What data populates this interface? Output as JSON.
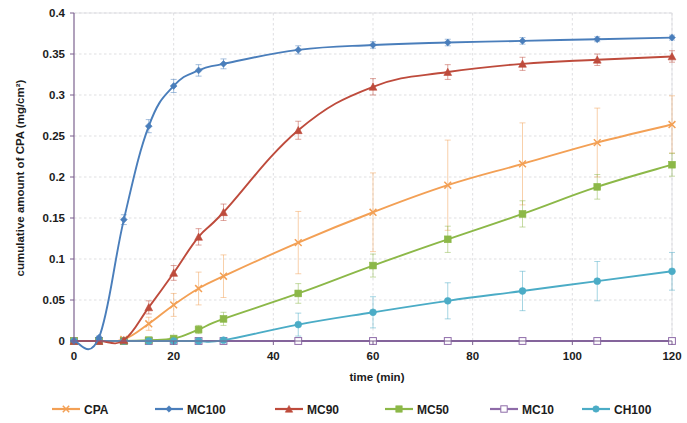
{
  "chart_data": {
    "type": "line",
    "title": "",
    "xlabel": "time (min)",
    "ylabel": "cumulative amount of CPA (mg/cm²)",
    "xlim": [
      0,
      120
    ],
    "ylim": [
      0,
      0.4
    ],
    "xticks": [
      "0",
      "20",
      "40",
      "60",
      "80",
      "100",
      "120"
    ],
    "xtick_values": [
      0,
      20,
      40,
      60,
      80,
      100,
      120
    ],
    "yticks": [
      "0",
      "0.05",
      "0.1",
      "0.15",
      "0.2",
      "0.25",
      "0.3",
      "0.35",
      "0.4"
    ],
    "ytick_values": [
      0,
      0.05,
      0.1,
      0.15,
      0.2,
      0.25,
      0.3,
      0.35,
      0.4
    ],
    "grid": true,
    "legend_position": "bottom",
    "x": [
      0,
      5,
      10,
      15,
      20,
      25,
      30,
      45,
      60,
      75,
      90,
      105,
      120
    ],
    "series": [
      {
        "name": "CPA",
        "color": "#F3A055",
        "marker": "cross",
        "values": [
          0,
          0,
          0.002,
          0.021,
          0.044,
          0.064,
          0.079,
          0.12,
          0.157,
          0.19,
          0.216,
          0.242,
          0.264
        ],
        "errors": [
          0,
          0,
          0.002,
          0.008,
          0.014,
          0.02,
          0.026,
          0.038,
          0.048,
          0.055,
          0.05,
          0.042,
          0.035
        ]
      },
      {
        "name": "MC100",
        "color": "#4A7EBB",
        "marker": "diamond",
        "values": [
          0,
          0.004,
          0.148,
          0.262,
          0.311,
          0.33,
          0.338,
          0.355,
          0.361,
          0.364,
          0.366,
          0.368,
          0.37
        ],
        "errors": [
          0,
          0.002,
          0.006,
          0.008,
          0.008,
          0.007,
          0.006,
          0.005,
          0.004,
          0.004,
          0.004,
          0.003,
          0.003
        ]
      },
      {
        "name": "MC90",
        "color": "#BE4B3C",
        "marker": "triangle",
        "values": [
          0,
          0,
          0.001,
          0.041,
          0.083,
          0.127,
          0.157,
          0.257,
          0.31,
          0.328,
          0.338,
          0.343,
          0.347
        ],
        "errors": [
          0,
          0,
          0.002,
          0.008,
          0.009,
          0.01,
          0.01,
          0.011,
          0.01,
          0.009,
          0.008,
          0.007,
          0.007
        ]
      },
      {
        "name": "MC50",
        "color": "#8CB848",
        "marker": "square",
        "values": [
          0,
          0,
          0,
          0.001,
          0.003,
          0.014,
          0.027,
          0.058,
          0.092,
          0.124,
          0.155,
          0.188,
          0.215
        ],
        "errors": [
          0,
          0,
          0,
          0.001,
          0.002,
          0.005,
          0.008,
          0.012,
          0.014,
          0.016,
          0.016,
          0.015,
          0.014
        ]
      },
      {
        "name": "MC10",
        "color": "#8E6BA8",
        "marker": "open-square",
        "values": [
          0,
          0,
          0,
          0,
          0,
          0,
          0,
          0,
          0,
          0,
          0,
          0,
          0
        ],
        "errors": [
          0,
          0,
          0,
          0,
          0,
          0,
          0,
          0,
          0,
          0,
          0,
          0,
          0
        ]
      },
      {
        "name": "CH100",
        "color": "#4BACC6",
        "marker": "circle",
        "values": [
          0,
          0,
          0,
          0,
          0,
          0,
          0.001,
          0.02,
          0.035,
          0.049,
          0.061,
          0.073,
          0.085
        ],
        "errors": [
          0,
          0,
          0,
          0,
          0,
          0,
          0.001,
          0.014,
          0.019,
          0.022,
          0.024,
          0.024,
          0.023
        ]
      }
    ]
  },
  "legend": {
    "items": [
      {
        "label": "CPA"
      },
      {
        "label": "MC100"
      },
      {
        "label": "MC90"
      },
      {
        "label": "MC50"
      },
      {
        "label": "MC10"
      },
      {
        "label": "CH100"
      }
    ]
  }
}
